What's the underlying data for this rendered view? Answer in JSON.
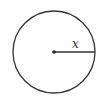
{
  "diagram": {
    "type": "circle-with-radius",
    "circle": {
      "cx": 54,
      "cy": 52,
      "r": 41,
      "stroke": "#333333"
    },
    "center_point": {
      "cx": 54,
      "cy": 52
    },
    "radius_segment": {
      "x1": 54,
      "y1": 52,
      "x2": 95,
      "y2": 52
    },
    "radius_label": "x"
  }
}
